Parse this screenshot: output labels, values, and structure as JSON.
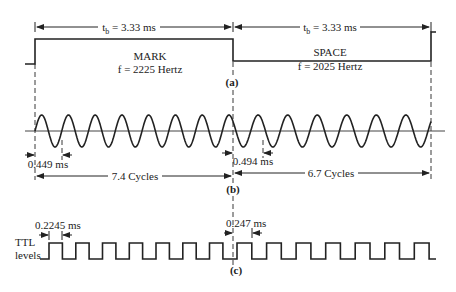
{
  "figure": {
    "panels": [
      {
        "id": "a",
        "label": "(a)",
        "description": "Binary data signal (MARK / SPACE)",
        "bit_time_label_left": "t",
        "bit_time_sub": "b",
        "bit_time_value": " = 3.33 ms",
        "mark_title": "MARK",
        "mark_freq": "f = 2225 Hertz",
        "space_title": "SPACE",
        "space_freq": "f = 2025 Hertz"
      },
      {
        "id": "b",
        "label": "(b)",
        "description": "FSK sine-wave output",
        "mark_period": "0.449 ms",
        "space_period": "0.494 ms",
        "mark_cycles": "7.4 Cycles",
        "space_cycles": "6.7 Cycles"
      },
      {
        "id": "c",
        "label": "(c)",
        "description": "TTL square-wave levels",
        "side_label_line1": "TTL",
        "side_label_line2": "levels",
        "mark_half_period": "0.2245 ms",
        "space_half_period": "0.247 ms"
      }
    ],
    "colors": {
      "ink": "#222222",
      "background": "#ffffff"
    }
  },
  "chart_data": {
    "type": "diagram",
    "bit_time_ms": 3.33,
    "mark": {
      "frequency_hz": 2225,
      "period_ms": 0.449,
      "half_period_ms": 0.2245,
      "cycles_per_bit": 7.4
    },
    "space": {
      "frequency_hz": 2025,
      "period_ms": 0.494,
      "half_period_ms": 0.247,
      "cycles_per_bit": 6.7
    }
  }
}
